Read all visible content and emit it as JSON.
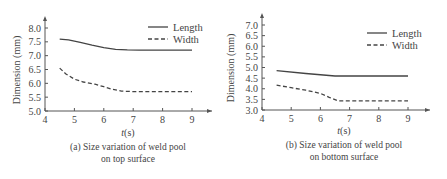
{
  "chart_data": [
    {
      "type": "line",
      "title": "",
      "caption": [
        "(a) Size variation of weld pool",
        "on top surface"
      ],
      "xlabel": "t(s)",
      "ylabel": "Dimension (mm)",
      "xlim": [
        4,
        9.6
      ],
      "ylim": [
        5.0,
        8.0
      ],
      "xticks": [
        4,
        5,
        6,
        7,
        8,
        9
      ],
      "yticks": [
        "5.0",
        "5.5",
        "6.0",
        "6.5",
        "7.0",
        "7.5",
        "8.0"
      ],
      "legend_position": "top-right",
      "series": [
        {
          "name": "Length",
          "style": "solid",
          "x": [
            4.5,
            4.8,
            5.2,
            5.6,
            6.0,
            6.4,
            6.8,
            7.2,
            8.0,
            9.0
          ],
          "y": [
            7.6,
            7.57,
            7.48,
            7.38,
            7.29,
            7.23,
            7.21,
            7.2,
            7.2,
            7.2
          ]
        },
        {
          "name": "Width",
          "style": "dashed",
          "x": [
            4.5,
            4.7,
            5.0,
            5.3,
            5.7,
            6.0,
            6.3,
            6.6,
            7.0,
            8.0,
            9.0
          ],
          "y": [
            6.55,
            6.35,
            6.15,
            6.05,
            5.97,
            5.88,
            5.78,
            5.72,
            5.7,
            5.7,
            5.7
          ]
        }
      ]
    },
    {
      "type": "line",
      "title": "",
      "caption": [
        "(b) Size variation of weld pool",
        "on bottom surface"
      ],
      "xlabel": "t(s)",
      "ylabel": "Dimension (mm)",
      "xlim": [
        4,
        9.7
      ],
      "ylim": [
        3.0,
        7.0
      ],
      "xticks": [
        4,
        5,
        6,
        7,
        8,
        9
      ],
      "yticks": [
        "3.0",
        "3.5",
        "4.0",
        "4.5",
        "5.0",
        "5.5",
        "6.0",
        "6.5",
        "7.0"
      ],
      "legend_position": "top-right",
      "series": [
        {
          "name": "Length",
          "style": "solid",
          "x": [
            4.5,
            5.5,
            6.5,
            7.0,
            8.0,
            9.0
          ],
          "y": [
            4.85,
            4.72,
            4.6,
            4.6,
            4.6,
            4.6
          ]
        },
        {
          "name": "Width",
          "style": "dashed",
          "x": [
            4.5,
            5.0,
            5.5,
            6.0,
            6.3,
            6.6,
            7.0,
            8.0,
            9.0
          ],
          "y": [
            4.17,
            4.05,
            3.93,
            3.78,
            3.6,
            3.43,
            3.43,
            3.43,
            3.43
          ]
        }
      ]
    }
  ]
}
